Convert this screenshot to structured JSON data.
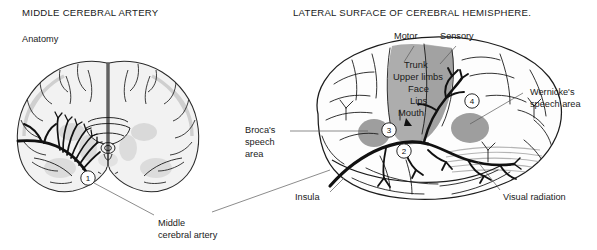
{
  "figure": {
    "left_panel": {
      "title": "MIDDLE CEREBRAL ARTERY",
      "subtitle": "Anatomy",
      "marker_1": "1",
      "callout": {
        "line1": "Middle",
        "line2": "cerebral artery"
      }
    },
    "right_panel": {
      "title": "LATERAL SURFACE OF CEREBRAL HEMISPHERE.",
      "cortex_labels": {
        "motor": "Motor",
        "sensory": "Sensory"
      },
      "homunculus": [
        "Trunk",
        "Upper limbs",
        "Face",
        "Lips",
        "Mouth"
      ],
      "brocas": {
        "line1": "Broca's",
        "line2": "speech",
        "line3": "area"
      },
      "wernickes": {
        "line1": "Wernicke's",
        "line2": "speech area"
      },
      "insula": "Insula",
      "visual_radiation": "Visual radiation",
      "markers": {
        "m2": "2",
        "m3": "3",
        "m4": "4"
      }
    }
  },
  "palette": {
    "ink": "#1c1c1c",
    "leader": "#5a5a5a",
    "cortex_fill": "#f2f2f2",
    "gyri_shade": "#d8d8d8",
    "strip_gray": "#a8a8a8",
    "blob_gray": "#9e9e9e",
    "white": "#ffffff",
    "artery": "#111111"
  }
}
